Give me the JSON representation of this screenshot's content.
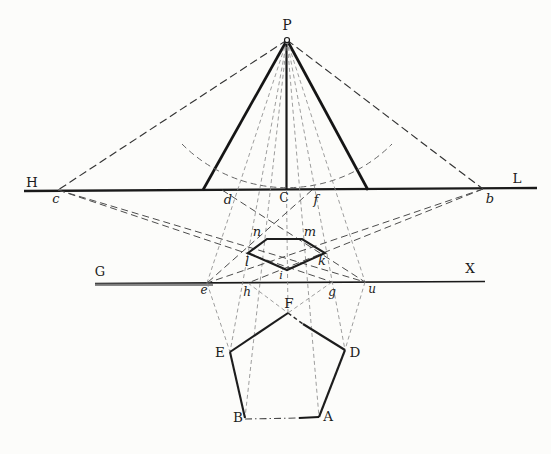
{
  "figure": {
    "width": 551,
    "height": 454,
    "background": "#fcfcfa",
    "ink_color": "#1a1a1a",
    "fine_dash_color": "#8c8c8c",
    "circles": [
      {
        "name": "station-point-P-marker",
        "cx": 287,
        "cy": 40,
        "r": 2.5
      }
    ],
    "paths": [
      {
        "name": "distance-arc",
        "cls": "dash-arc",
        "d": "M 182 144 A 148 148 0 0 0 392 144"
      }
    ],
    "polygons": [
      {
        "name": "pentagon-perspective-image",
        "cls": "ln-shape",
        "pts": "267,239 302,239 325,253 287,270 248,253"
      }
    ],
    "lines": [
      {
        "name": "horizon-line-HL",
        "cls": "ln-main",
        "x1": 24,
        "y1": 191,
        "x2": 537,
        "y2": 188
      },
      {
        "name": "ground-line-GX",
        "cls": "ln-thin",
        "x1": 95,
        "y1": 283.5,
        "x2": 485,
        "y2": 281.5
      },
      {
        "name": "ground-line-GX-heavy-left",
        "cls": "ln-overlay",
        "x1": 95,
        "y1": 284.5,
        "x2": 213,
        "y2": 284.5
      },
      {
        "name": "cone-left-leg",
        "cls": "ln-thick",
        "x1": 287,
        "y1": 40,
        "x2": 203,
        "y2": 190
      },
      {
        "name": "cone-right-leg",
        "cls": "ln-thick",
        "x1": 287,
        "y1": 40,
        "x2": 368,
        "y2": 190
      },
      {
        "name": "center-line-P-C",
        "cls": "ln-mid",
        "x1": 286.5,
        "y1": 40,
        "x2": 286.5,
        "y2": 190
      },
      {
        "name": "ray-P-c",
        "cls": "dash-main",
        "x1": 287,
        "y1": 40,
        "x2": 58,
        "y2": 190
      },
      {
        "name": "ray-P-b",
        "cls": "dash-main",
        "x1": 287,
        "y1": 40,
        "x2": 483,
        "y2": 189
      },
      {
        "name": "visual-ray-P-e",
        "cls": "dash-fine",
        "x1": 287,
        "y1": 40,
        "x2": 207,
        "y2": 283
      },
      {
        "name": "visual-ray-P-u",
        "cls": "dash-fine",
        "x1": 287,
        "y1": 40,
        "x2": 365,
        "y2": 282
      },
      {
        "name": "visual-ray-P-E",
        "cls": "dash-fine",
        "x1": 287,
        "y1": 40,
        "x2": 230,
        "y2": 352
      },
      {
        "name": "visual-ray-P-B",
        "cls": "dash-fine",
        "x1": 287,
        "y1": 40,
        "x2": 245,
        "y2": 418
      },
      {
        "name": "visual-ray-P-A",
        "cls": "dash-fine",
        "x1": 287,
        "y1": 40,
        "x2": 319,
        "y2": 417
      },
      {
        "name": "visual-ray-P-D",
        "cls": "dash-fine",
        "x1": 287,
        "y1": 40,
        "x2": 345,
        "y2": 350
      },
      {
        "name": "center-line-C-F",
        "cls": "dash-fine",
        "x1": 286.5,
        "y1": 190,
        "x2": 288,
        "y2": 313
      },
      {
        "name": "distance-line-c-g",
        "cls": "dash-long",
        "x1": 58,
        "y1": 190,
        "x2": 332,
        "y2": 282
      },
      {
        "name": "distance-line-c-u",
        "cls": "dash-long",
        "x1": 58,
        "y1": 190,
        "x2": 365,
        "y2": 282
      },
      {
        "name": "distance-line-b-h",
        "cls": "dash-long",
        "x1": 483,
        "y1": 189,
        "x2": 248,
        "y2": 283
      },
      {
        "name": "distance-line-b-e",
        "cls": "dash-long",
        "x1": 483,
        "y1": 189,
        "x2": 207,
        "y2": 283
      },
      {
        "name": "construction-line-d-u",
        "cls": "dash-long",
        "x1": 222,
        "y1": 190,
        "x2": 365,
        "y2": 282
      },
      {
        "name": "construction-line-f-e",
        "cls": "dash-long",
        "x1": 312,
        "y1": 190,
        "x2": 207,
        "y2": 283
      },
      {
        "name": "projector-e-E",
        "cls": "dash-fine",
        "x1": 207,
        "y1": 283,
        "x2": 230,
        "y2": 352
      },
      {
        "name": "projector-u-D",
        "cls": "dash-fine",
        "x1": 365,
        "y1": 282,
        "x2": 345,
        "y2": 350
      },
      {
        "name": "projector-h-F",
        "cls": "dash-fine",
        "x1": 248,
        "y1": 283,
        "x2": 288,
        "y2": 313
      },
      {
        "name": "projector-g-F",
        "cls": "dash-fine",
        "x1": 332,
        "y1": 282,
        "x2": 288,
        "y2": 313
      },
      {
        "name": "plan-edge-F-E",
        "cls": "ln-shape",
        "x1": 288,
        "y1": 313,
        "x2": 230,
        "y2": 352
      },
      {
        "name": "plan-edge-E-B",
        "cls": "ln-shape",
        "x1": 230,
        "y1": 352,
        "x2": 245,
        "y2": 418
      },
      {
        "name": "plan-edge-F-D-broken",
        "cls": "dash-shape",
        "x1": 288,
        "y1": 313,
        "x2": 303,
        "y2": 324
      },
      {
        "name": "plan-edge-F-D-solid",
        "cls": "ln-shape",
        "x1": 303,
        "y1": 324,
        "x2": 345,
        "y2": 350
      },
      {
        "name": "plan-edge-D-A",
        "cls": "ln-shape",
        "x1": 345,
        "y1": 350,
        "x2": 319,
        "y2": 417
      },
      {
        "name": "plan-edge-B-A-dashed",
        "cls": "dash-dot",
        "x1": 245,
        "y1": 419,
        "x2": 299,
        "y2": 418
      },
      {
        "name": "plan-edge-B-A-solid",
        "cls": "ln-mid",
        "x1": 299,
        "y1": 418,
        "x2": 319,
        "y2": 417
      }
    ],
    "labels": [
      {
        "name": "label-P",
        "t": "P",
        "x": 287,
        "y": 30,
        "cls": "roman",
        "fs": 14
      },
      {
        "name": "label-H",
        "t": "H",
        "x": 32,
        "y": 187,
        "cls": "roman",
        "fs": 13.5
      },
      {
        "name": "label-L",
        "t": "L",
        "x": 517,
        "y": 183,
        "cls": "roman",
        "fs": 13.5
      },
      {
        "name": "label-c",
        "t": "c",
        "x": 56,
        "y": 203,
        "cls": "italic",
        "fs": 13
      },
      {
        "name": "label-d",
        "t": "d",
        "x": 228,
        "y": 204,
        "cls": "italic",
        "fs": 13
      },
      {
        "name": "label-C",
        "t": "C",
        "x": 284,
        "y": 202,
        "cls": "roman",
        "fs": 12.5
      },
      {
        "name": "label-f",
        "t": "f",
        "x": 316,
        "y": 204,
        "cls": "italic",
        "fs": 13
      },
      {
        "name": "label-b",
        "t": "b",
        "x": 490,
        "y": 203,
        "cls": "italic",
        "fs": 13
      },
      {
        "name": "label-n",
        "t": "n",
        "x": 257,
        "y": 236,
        "cls": "italic",
        "fs": 13
      },
      {
        "name": "label-m",
        "t": "m",
        "x": 310,
        "y": 236,
        "cls": "italic",
        "fs": 13
      },
      {
        "name": "label-l",
        "t": "l",
        "x": 247,
        "y": 266,
        "cls": "italic",
        "fs": 13
      },
      {
        "name": "label-k",
        "t": "k",
        "x": 322,
        "y": 265,
        "cls": "italic",
        "fs": 13
      },
      {
        "name": "label-i",
        "t": "i",
        "x": 281,
        "y": 279,
        "cls": "italic",
        "fs": 11
      },
      {
        "name": "label-G",
        "t": "G",
        "x": 100,
        "y": 276,
        "cls": "roman",
        "fs": 13
      },
      {
        "name": "label-X",
        "t": "X",
        "x": 470,
        "y": 273,
        "cls": "roman",
        "fs": 13.5
      },
      {
        "name": "label-e",
        "t": "e",
        "x": 204,
        "y": 294,
        "cls": "italic",
        "fs": 12
      },
      {
        "name": "label-h",
        "t": "h",
        "x": 247,
        "y": 296,
        "cls": "italic",
        "fs": 12
      },
      {
        "name": "label-g",
        "t": "g",
        "x": 332,
        "y": 296,
        "cls": "italic",
        "fs": 12
      },
      {
        "name": "label-u",
        "t": "u",
        "x": 372,
        "y": 293,
        "cls": "italic",
        "fs": 12
      },
      {
        "name": "label-F",
        "t": "F",
        "x": 289,
        "y": 308,
        "cls": "roman",
        "fs": 13.5
      },
      {
        "name": "label-E",
        "t": "E",
        "x": 220,
        "y": 357,
        "cls": "roman",
        "fs": 13.5
      },
      {
        "name": "label-D",
        "t": "D",
        "x": 355,
        "y": 357,
        "cls": "roman",
        "fs": 13.5
      },
      {
        "name": "label-B",
        "t": "B",
        "x": 238,
        "y": 422,
        "cls": "roman",
        "fs": 13.5
      },
      {
        "name": "label-A",
        "t": "A",
        "x": 328,
        "y": 421,
        "cls": "roman",
        "fs": 13.5
      }
    ]
  }
}
